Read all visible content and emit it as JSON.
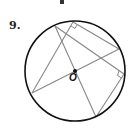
{
  "problem": {
    "number": "9."
  },
  "diagram": {
    "center_label": "O",
    "circle": {
      "cx": 75,
      "cy": 71,
      "r": 50,
      "stroke": "#111111"
    },
    "chord_color": "#888888",
    "points": {
      "A": [
        55,
        26
      ],
      "B": [
        73,
        22
      ],
      "C": [
        119,
        49
      ],
      "D": [
        124,
        74
      ],
      "E": [
        32,
        93
      ],
      "F": [
        96,
        117
      ]
    },
    "segments": [
      [
        "E",
        "B"
      ],
      [
        "E",
        "C"
      ],
      [
        "A",
        "F"
      ],
      [
        "B",
        "C"
      ],
      [
        "A",
        "D"
      ],
      [
        "D",
        "F"
      ]
    ],
    "right_angles": [
      "B",
      "D"
    ]
  }
}
